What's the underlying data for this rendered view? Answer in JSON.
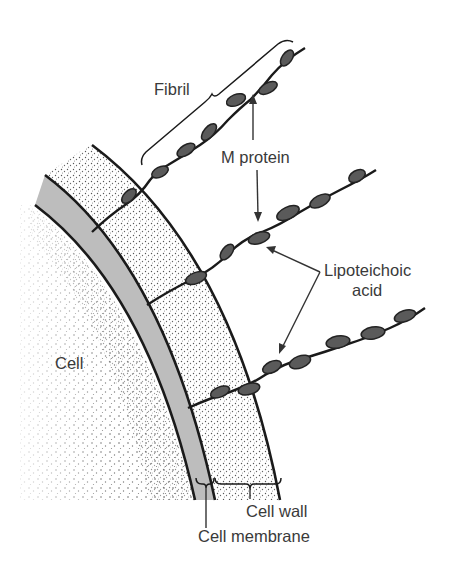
{
  "figure": {
    "labels": {
      "fibril": "Fibril",
      "m_protein": "M protein",
      "lipoteichoic_line1": "Lipoteichoic",
      "lipoteichoic_line2": "acid",
      "cell": "Cell",
      "cell_wall": "Cell wall",
      "cell_membrane": "Cell membrane"
    },
    "structures": [
      {
        "name": "Cell",
        "fill": "stippled dots"
      },
      {
        "name": "Cell membrane",
        "fill": "#bdbdbd"
      },
      {
        "name": "Cell wall",
        "fill": "stippled dots"
      },
      {
        "name": "Fibril",
        "count": 3,
        "beads_color": "#555555"
      }
    ],
    "colors": {
      "outline": "#1a1a1a",
      "membrane": "#bdbdbd",
      "bead": "#5a5a5a",
      "text": "#3a3a3a",
      "background": "#ffffff"
    }
  }
}
